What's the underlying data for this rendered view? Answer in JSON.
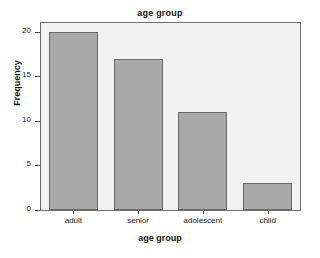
{
  "chart_data": {
    "type": "bar",
    "title": "age group",
    "xlabel": "age group",
    "ylabel": "Frequency",
    "categories": [
      "adult",
      "senior",
      "adolescent",
      "child"
    ],
    "values": [
      20,
      17,
      11,
      3
    ],
    "ylim": [
      0,
      21
    ],
    "yticks": [
      0,
      5,
      10,
      15,
      20
    ],
    "ytick_labels": [
      "0",
      "5",
      "10",
      "15",
      "20"
    ],
    "grid": false,
    "legend": "none",
    "bar_color": "#a9a9a9",
    "bar_edge_color": "#6a6a6a",
    "plot_background": "#f2f2f2",
    "figure_background": "#ffffff"
  }
}
